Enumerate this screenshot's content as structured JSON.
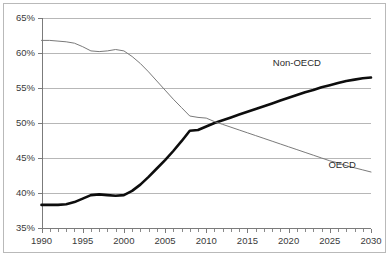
{
  "chart_data": {
    "type": "line",
    "title": "",
    "subtitle": "",
    "xlabel": "",
    "ylabel": "",
    "xlim": [
      1990,
      2030
    ],
    "ylim": [
      35,
      65
    ],
    "grid": true,
    "grid_axis": "y",
    "legend_position": "inline-annotations",
    "y_tick_labels": [
      "65%",
      "60%",
      "55%",
      "50%",
      "45%",
      "40%",
      "35%"
    ],
    "y_ticks": [
      65,
      60,
      55,
      50,
      45,
      40,
      35
    ],
    "y_tick_suffix": "%",
    "x_tick_labels": [
      "1990",
      "1995",
      "2000",
      "2005",
      "2010",
      "2015",
      "2020",
      "2025",
      "2030"
    ],
    "x_ticks": [
      1990,
      1995,
      2000,
      2005,
      2010,
      2015,
      2020,
      2025,
      2030
    ],
    "x_minor_tick_interval": 1,
    "series": [
      {
        "name": "Non-OECD",
        "label": "Non-OECD",
        "style": "thick-black",
        "color": "#0d0d0d",
        "label_x": 2021.0,
        "label_y": 58.6,
        "x": [
          1990,
          1991,
          1992,
          1993,
          1994,
          1995,
          1996,
          1997,
          1998,
          1999,
          2000,
          2001,
          2002,
          2003,
          2004,
          2005,
          2006,
          2007,
          2008,
          2009,
          2010,
          2011,
          2012,
          2013,
          2014,
          2015,
          2016,
          2017,
          2018,
          2019,
          2020,
          2021,
          2022,
          2023,
          2024,
          2025,
          2026,
          2027,
          2028,
          2029,
          2030
        ],
        "values": [
          38.3,
          38.3,
          38.3,
          38.4,
          38.7,
          39.2,
          39.7,
          39.8,
          39.7,
          39.6,
          39.7,
          40.3,
          41.2,
          42.3,
          43.5,
          44.7,
          46.0,
          47.4,
          48.9,
          49.0,
          49.5,
          50.0,
          50.4,
          50.8,
          51.2,
          51.6,
          52.0,
          52.4,
          52.8,
          53.2,
          53.6,
          54.0,
          54.4,
          54.7,
          55.1,
          55.4,
          55.7,
          56.0,
          56.2,
          56.4,
          56.5
        ]
      },
      {
        "name": "OECD",
        "label": "OECD",
        "style": "thin-grey",
        "color": "#7a7a7a",
        "label_x": 2026.5,
        "label_y": 44.0,
        "x": [
          1990,
          1991,
          1992,
          1993,
          1994,
          1995,
          1996,
          1997,
          1998,
          1999,
          2000,
          2001,
          2002,
          2003,
          2004,
          2005,
          2006,
          2007,
          2008,
          2009,
          2010,
          2011,
          2012,
          2013,
          2014,
          2015,
          2016,
          2017,
          2018,
          2019,
          2020,
          2021,
          2022,
          2023,
          2024,
          2025,
          2026,
          2027,
          2028,
          2029,
          2030
        ],
        "values": [
          61.8,
          61.8,
          61.7,
          61.6,
          61.4,
          60.9,
          60.3,
          60.2,
          60.3,
          60.5,
          60.3,
          59.5,
          58.5,
          57.3,
          56.0,
          54.7,
          53.4,
          52.2,
          51.0,
          50.8,
          50.7,
          50.2,
          49.8,
          49.4,
          49.0,
          48.6,
          48.2,
          47.8,
          47.4,
          47.0,
          46.6,
          46.2,
          45.8,
          45.4,
          45.0,
          44.6,
          44.3,
          43.9,
          43.6,
          43.3,
          43.0
        ]
      }
    ],
    "annotations": [
      {
        "text": "Non-OECD",
        "x": 2021.0,
        "y": 58.6
      },
      {
        "text": "OECD",
        "x": 2026.5,
        "y": 44.0
      }
    ],
    "colors": {
      "non_oecd": "#0d0d0d",
      "oecd": "#7a7a7a",
      "gridline": "#a5a5a5",
      "axis": "#6d6d6d",
      "frame": "#b9b9b9",
      "background": "#ffffff",
      "text": "#3a3a3a"
    }
  }
}
